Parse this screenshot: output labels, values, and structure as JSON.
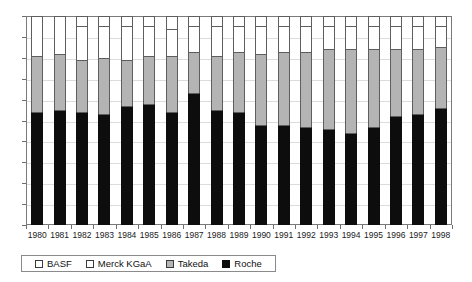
{
  "chart_data": {
    "type": "bar",
    "stacked": true,
    "stack_mode": "percent",
    "title": "",
    "subtitle": "",
    "xlabel": "",
    "ylabel": "",
    "ylim": [
      0,
      100
    ],
    "grid": true,
    "legend_position": "bottom-left",
    "categories": [
      "1980",
      "1981",
      "1982",
      "1983",
      "1984",
      "1985",
      "1986",
      "1987",
      "1988",
      "1989",
      "1990",
      "1991",
      "1992",
      "1993",
      "1994",
      "1995",
      "1996",
      "1997",
      "1998"
    ],
    "y_ticks": [
      "0%",
      "10%",
      "20%",
      "30%",
      "40%",
      "50%",
      "60%",
      "70%",
      "80%",
      "90%",
      "100%"
    ],
    "y_tick_values": [
      0,
      10,
      20,
      30,
      40,
      50,
      60,
      70,
      80,
      90,
      100
    ],
    "series": [
      {
        "name": "Roche",
        "color": "#0d0d0d",
        "values": [
          54,
          55,
          54,
          53,
          57,
          58,
          54,
          63,
          55,
          54,
          48,
          48,
          47,
          46,
          44,
          47,
          52,
          53,
          56
        ]
      },
      {
        "name": "Takeda",
        "color": "#b4b4b4",
        "values": [
          27,
          27,
          25,
          27,
          22,
          23,
          27,
          20,
          26,
          29,
          34,
          35,
          36,
          38,
          40,
          37,
          32,
          31,
          29
        ]
      },
      {
        "name": "Merck KGaA",
        "color": "#ffffff",
        "values": [
          19,
          18,
          16,
          15,
          16,
          14,
          13,
          12,
          14,
          12,
          13,
          12,
          12,
          11,
          11,
          11,
          11,
          11,
          10
        ]
      },
      {
        "name": "BASF",
        "color": "#ffffff",
        "values": [
          0,
          0,
          5,
          5,
          5,
          5,
          6,
          5,
          5,
          5,
          5,
          5,
          5,
          5,
          5,
          5,
          5,
          5,
          5
        ]
      }
    ]
  },
  "legend": {
    "items": [
      {
        "label": "BASF",
        "swatch": "basf-swatch"
      },
      {
        "label": "Merck KGaA",
        "swatch": "merck-swatch"
      },
      {
        "label": "Takeda",
        "swatch": "takeda-swatch"
      },
      {
        "label": "Roche",
        "swatch": "roche-swatch"
      }
    ]
  }
}
